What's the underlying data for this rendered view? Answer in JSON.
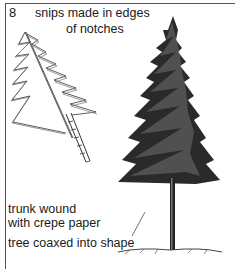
{
  "figure": {
    "number": "8",
    "labels": {
      "snips_line1": "snips made in edges",
      "snips_line2": "of notches",
      "trunk_line1": "trunk wound",
      "trunk_line2": "with crepe paper",
      "coaxed": "tree coaxed into shape"
    },
    "colors": {
      "ink": "#1a1a1a",
      "border": "#555555",
      "background": "#ffffff"
    },
    "illustrations": [
      {
        "name": "paper-tree-outline",
        "description": "notched paper tree cutout with snips on edges and a crepe-wrapped trunk"
      },
      {
        "name": "finished-pine-tree",
        "description": "shaded conifer tree shaped from the cutout"
      }
    ]
  }
}
